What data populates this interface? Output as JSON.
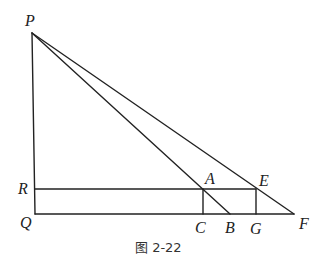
{
  "figure": {
    "caption": "图 2-22",
    "points": {
      "P": "P",
      "Q": "Q",
      "R": "R",
      "A": "A",
      "B": "B",
      "C": "C",
      "E": "E",
      "F": "F",
      "G": "G"
    },
    "segments": [
      "PQ",
      "QF",
      "RE",
      "PB",
      "PF",
      "AC",
      "EG"
    ]
  }
}
